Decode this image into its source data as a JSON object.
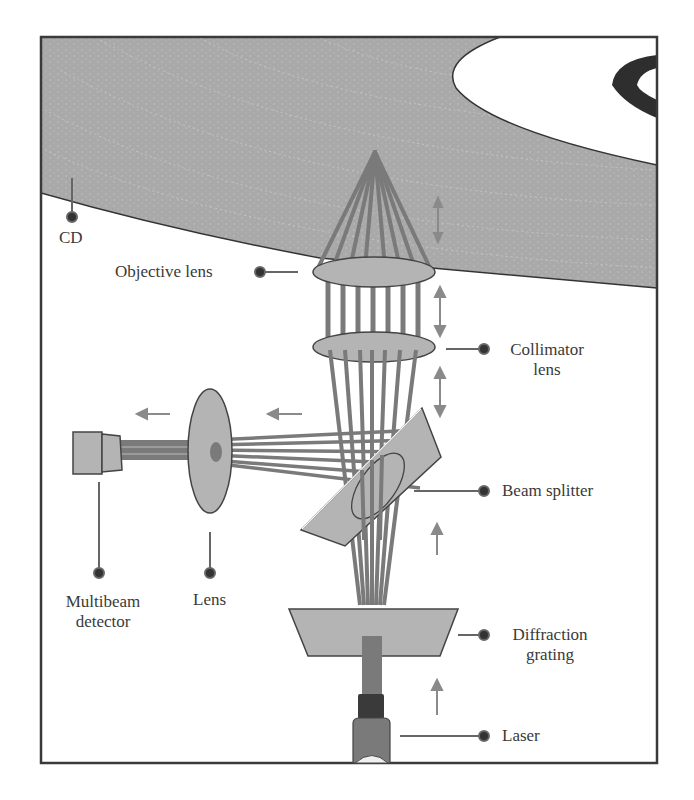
{
  "figure": {
    "colors": {
      "disc_fill": "#a9a9a9",
      "disc_track": "#c8c8c8",
      "component_fill": "#b4b4b4",
      "beam": "#7a7a7a",
      "outline": "#444444",
      "arrow": "#8a8a8a",
      "label_dot": "#333333",
      "text": "#3a3a3a"
    }
  },
  "labels": {
    "cd": "CD",
    "objective_lens": "Objective lens",
    "collimator_lens_1": "Collimator",
    "collimator_lens_2": "lens",
    "beam_splitter": "Beam splitter",
    "multibeam_detector_1": "Multibeam",
    "multibeam_detector_2": "detector",
    "lens": "Lens",
    "diffraction_grating_1": "Diffraction",
    "diffraction_grating_2": "grating",
    "laser": "Laser"
  },
  "motion_arrows": {
    "vertical_double": 3,
    "up_single": 2,
    "left_single": 2
  }
}
